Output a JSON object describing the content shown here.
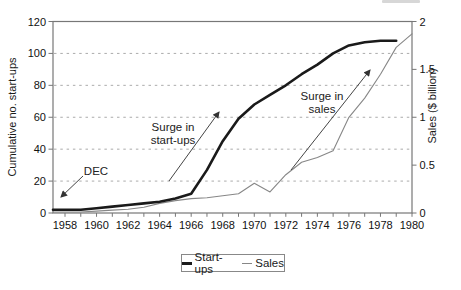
{
  "chart_data": {
    "type": "line",
    "title": "",
    "x_axis": {
      "label": "",
      "tick_labels": [
        "1958",
        "1960",
        "1962",
        "1964",
        "1966",
        "1968",
        "1970",
        "1972",
        "1974",
        "1976",
        "1978",
        "1980"
      ],
      "minor_tick_step_years": 1,
      "range": [
        1957,
        1980
      ]
    },
    "y_left": {
      "label": "Cumulative no. start-ups",
      "ticks": [
        0,
        20,
        40,
        60,
        80,
        100,
        120
      ],
      "range": [
        0,
        120
      ]
    },
    "y_right": {
      "label": "Sales ($ billion)",
      "ticks": [
        "0",
        "0.5",
        "1",
        "1.5",
        "2"
      ],
      "range": [
        0,
        2
      ]
    },
    "gridlines_left": [
      20,
      40,
      60,
      80,
      100
    ],
    "grid_style": "horizontal-dashed",
    "colors": {
      "startups_line": "#1a1a1a",
      "sales_line": "#878787",
      "grid": "#ababab",
      "frame": "#777777",
      "arrow": "#444444",
      "text": "#111111"
    },
    "legend": {
      "position": "bottom-center",
      "items": [
        {
          "label": "Start-ups",
          "style": "thick-black-line"
        },
        {
          "label": "Sales",
          "style": "thin-gray-line"
        }
      ]
    },
    "series": [
      {
        "name": "Start-ups",
        "axis": "left",
        "color": "#1a1a1a",
        "width": 2.6,
        "points": [
          [
            1957,
            2
          ],
          [
            1958,
            2
          ],
          [
            1959,
            2
          ],
          [
            1960,
            3
          ],
          [
            1961,
            4
          ],
          [
            1962,
            5
          ],
          [
            1963,
            6
          ],
          [
            1964,
            7
          ],
          [
            1965,
            9
          ],
          [
            1966,
            12
          ],
          [
            1967,
            27
          ],
          [
            1968,
            45
          ],
          [
            1969,
            59
          ],
          [
            1970,
            68
          ],
          [
            1971,
            74
          ],
          [
            1972,
            80
          ],
          [
            1973,
            87
          ],
          [
            1974,
            93
          ],
          [
            1975,
            100
          ],
          [
            1976,
            105
          ],
          [
            1977,
            107
          ],
          [
            1978,
            108
          ],
          [
            1979,
            108
          ]
        ]
      },
      {
        "name": "Sales",
        "axis": "right",
        "color": "#878787",
        "width": 1.1,
        "points": [
          [
            1957,
            0.01
          ],
          [
            1958,
            0.01
          ],
          [
            1959,
            0.01
          ],
          [
            1960,
            0.02
          ],
          [
            1961,
            0.03
          ],
          [
            1962,
            0.04
          ],
          [
            1963,
            0.06
          ],
          [
            1964,
            0.1
          ],
          [
            1965,
            0.13
          ],
          [
            1966,
            0.15
          ],
          [
            1967,
            0.16
          ],
          [
            1968,
            0.18
          ],
          [
            1969,
            0.2
          ],
          [
            1970,
            0.31
          ],
          [
            1971,
            0.22
          ],
          [
            1972,
            0.4
          ],
          [
            1973,
            0.53
          ],
          [
            1974,
            0.58
          ],
          [
            1975,
            0.65
          ],
          [
            1976,
            1.0
          ],
          [
            1977,
            1.2
          ],
          [
            1978,
            1.45
          ],
          [
            1979,
            1.73
          ],
          [
            1980,
            1.87
          ]
        ]
      }
    ],
    "annotations": [
      {
        "lines": [
          "DEC"
        ],
        "target": "start of Start-ups line (1957)",
        "arrow": {
          "from": [
            83,
            176
          ],
          "to": [
            61,
            197
          ]
        }
      },
      {
        "lines": [
          "Surge in",
          "start-ups"
        ],
        "target": "steep rise of Start-ups line 1966-1969",
        "arrow": {
          "from": [
            169,
            181
          ],
          "to": [
            219,
            112
          ]
        }
      },
      {
        "lines": [
          "Surge in",
          "sales"
        ],
        "target": "steep rise of Sales line 1975-1980",
        "arrow": {
          "from": [
            291,
            170
          ],
          "to": [
            370,
            70
          ]
        }
      }
    ]
  }
}
